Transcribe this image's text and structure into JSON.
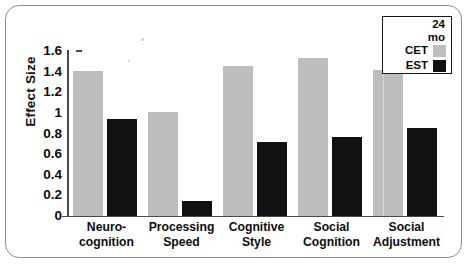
{
  "chart_data": {
    "type": "bar",
    "title": "",
    "xlabel": "",
    "ylabel": "Effect Size",
    "ylim": [
      0,
      1.6
    ],
    "ytick_labels": [
      "1.6",
      "1.4",
      "1.2",
      "1",
      "0.8",
      "0.6",
      "0.4",
      "0.2",
      "0"
    ],
    "ytick_values": [
      1.6,
      1.4,
      1.2,
      1.0,
      0.8,
      0.6,
      0.4,
      0.2,
      0
    ],
    "grid": false,
    "legend_position": "top-right",
    "legend_title": "24 mo",
    "categories": [
      "Neuro-cognition",
      "Processing Speed",
      "Cognitive Style",
      "Social Cognition",
      "Social Adjustment"
    ],
    "category_lines": [
      [
        "Neuro-",
        "cognition"
      ],
      [
        "Processing",
        "Speed"
      ],
      [
        "Cognitive",
        "Style"
      ],
      [
        "Social",
        "Cognition"
      ],
      [
        "Social",
        "Adjustment"
      ]
    ],
    "series": [
      {
        "name": "CET",
        "color": "#bdbdbd",
        "values": [
          1.41,
          1.01,
          1.45,
          1.53,
          1.42
        ]
      },
      {
        "name": "EST",
        "color": "#111111",
        "values": [
          0.94,
          0.15,
          0.72,
          0.77,
          0.85
        ]
      }
    ]
  },
  "legend": {
    "title_lines": [
      "24",
      "mo"
    ],
    "entries": [
      {
        "label": "CET",
        "swatch": "cet"
      },
      {
        "label": "EST",
        "swatch": "est"
      }
    ]
  },
  "axes": {
    "y_title": "Effect Size"
  },
  "colors": {
    "cet": "#bdbdbd",
    "est": "#111111",
    "axis": "#4a4a4a",
    "frame": "#8d8d8d",
    "text": "#0d0d0d"
  }
}
